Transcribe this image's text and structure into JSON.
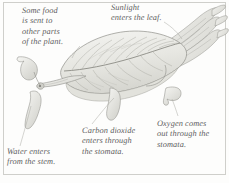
{
  "figure": {
    "kind": "botanical-illustration",
    "background_color": "#fdfdfc",
    "ink_color": "#8d8d88",
    "text_color": "#5d5d5f",
    "frame_color": "#cfcfcb"
  },
  "callouts": {
    "food": "Some food\nis sent to\nother parts\nof the plant.",
    "sunlight": "Sunlight\nenters the leaf.",
    "carbon_dioxide": "Carbon dioxide\nenters through\nthe stomata.",
    "oxygen": "Oxygen comes\nout through the\nstomata.",
    "water": "Water enters\nfrom the stem."
  }
}
